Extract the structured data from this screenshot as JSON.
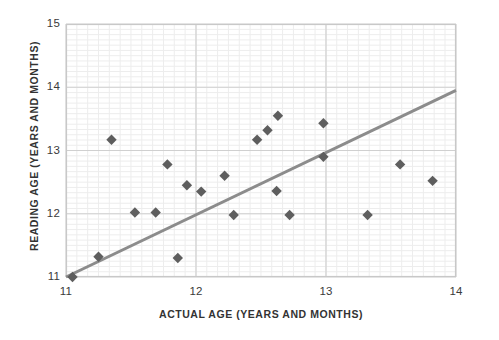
{
  "chart_data": {
    "type": "scatter",
    "title": "",
    "xlabel": "ACTUAL AGE (YEARS AND MONTHS)",
    "ylabel": "READING AGE (YEARS AND MONTHS)",
    "xlim": [
      11,
      14
    ],
    "ylim": [
      11,
      15
    ],
    "xticks": [
      11,
      12,
      13,
      14
    ],
    "yticks": [
      11,
      12,
      13,
      14,
      15
    ],
    "xtick_labels": [
      "11",
      "12",
      "13",
      "14"
    ],
    "ytick_labels": [
      "11",
      "12",
      "13",
      "14",
      "15"
    ],
    "grid": true,
    "minor_grid": true,
    "minor_grid_step": 0.0833,
    "legend": "none",
    "marker": "diamond",
    "marker_color": "#5e5e5e",
    "grid_major_color": "#d0d0d0",
    "grid_minor_color": "#ededed",
    "frame_color": "#c8c8c8",
    "points": [
      {
        "x": 11.05,
        "y": 11.0
      },
      {
        "x": 11.25,
        "y": 11.32
      },
      {
        "x": 11.35,
        "y": 13.17
      },
      {
        "x": 11.53,
        "y": 12.02
      },
      {
        "x": 11.69,
        "y": 12.02
      },
      {
        "x": 11.78,
        "y": 12.78
      },
      {
        "x": 11.86,
        "y": 11.3
      },
      {
        "x": 11.93,
        "y": 12.45
      },
      {
        "x": 12.04,
        "y": 12.35
      },
      {
        "x": 12.22,
        "y": 12.6
      },
      {
        "x": 12.29,
        "y": 11.98
      },
      {
        "x": 12.47,
        "y": 13.17
      },
      {
        "x": 12.55,
        "y": 13.32
      },
      {
        "x": 12.63,
        "y": 13.55
      },
      {
        "x": 12.62,
        "y": 12.36
      },
      {
        "x": 12.72,
        "y": 11.98
      },
      {
        "x": 12.98,
        "y": 13.43
      },
      {
        "x": 12.98,
        "y": 12.9
      },
      {
        "x": 13.32,
        "y": 11.98
      },
      {
        "x": 13.57,
        "y": 12.78
      },
      {
        "x": 13.82,
        "y": 12.52
      }
    ],
    "trendline": {
      "type": "line-of-best-fit",
      "color": "#8c8c8c",
      "width": 3,
      "x_start": 11.0,
      "y_start": 11.0,
      "x_end": 14.0,
      "y_end": 13.95
    }
  }
}
